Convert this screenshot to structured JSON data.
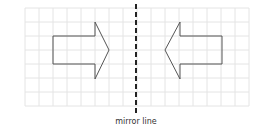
{
  "diagram": {
    "label": "mirror line",
    "colors": {
      "grid": "#e4e4e4",
      "shape_stroke": "#555555",
      "mirror_line": "#222222",
      "label": "#333333"
    },
    "grid": {
      "x0": 25,
      "y0": 8,
      "cell": 14,
      "cols": 16,
      "rows": 7
    },
    "mirror_line": {
      "x": 136,
      "y1": 4,
      "y2": 116
    },
    "shapes": [
      {
        "name": "original-arrow",
        "direction": "right",
        "points": [
          [
            53,
            36
          ],
          [
            95,
            36
          ],
          [
            95,
            22
          ],
          [
            109,
            50
          ],
          [
            95,
            79
          ],
          [
            95,
            64
          ],
          [
            53,
            64
          ]
        ]
      },
      {
        "name": "reflected-arrow",
        "direction": "left",
        "points": [
          [
            222,
            36
          ],
          [
            180,
            36
          ],
          [
            180,
            22
          ],
          [
            165,
            50
          ],
          [
            180,
            79
          ],
          [
            180,
            64
          ],
          [
            222,
            64
          ]
        ]
      }
    ]
  }
}
